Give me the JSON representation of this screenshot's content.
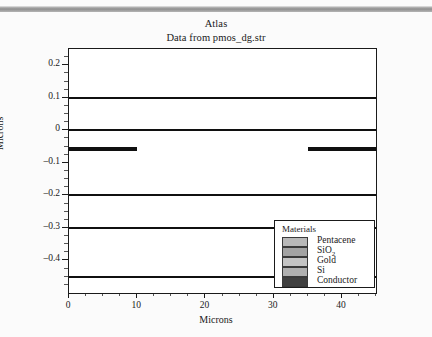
{
  "window": {
    "titlebar_name": "window-titlebar"
  },
  "header": {
    "title": "Atlas",
    "subtitle": "Data from pmos_dg.str"
  },
  "legend": {
    "title": "Materials",
    "items": [
      {
        "label": "Pentacene",
        "color": "#b8b8b8"
      },
      {
        "label": "SiO2",
        "color": "#a3a3a3"
      },
      {
        "label": "Gold",
        "color": "#c4c4c4"
      },
      {
        "label": "Si",
        "color": "#b0b0b0"
      },
      {
        "label": "Conductor",
        "color": "#404040"
      }
    ]
  },
  "chart_data": {
    "type": "area",
    "title": "Atlas",
    "subtitle": "Data from pmos_dg.str",
    "xlabel": "Microns",
    "ylabel": "Microns",
    "xlim": [
      0,
      45
    ],
    "ylim": [
      0.25,
      -0.5
    ],
    "xticks": [
      0,
      10,
      20,
      30,
      40
    ],
    "yticks": [
      -0.4,
      -0.3,
      -0.2,
      -0.1,
      0,
      0.1,
      0.2
    ],
    "xtick_labels": [
      "0",
      "10",
      "20",
      "30",
      "40"
    ],
    "ytick_labels": [
      "–0.4",
      "–0.3",
      "–0.2",
      "–0.1",
      "0",
      "0.1",
      "0.2"
    ],
    "grid": false,
    "legend_position": "bottom-right",
    "y_axis_inverted": true,
    "regions": [
      {
        "material": "background",
        "color": "#ffffff",
        "x0": 0,
        "x1": 45,
        "y0": -0.5,
        "y1": -0.45
      },
      {
        "material": "Conductor",
        "color": "#404040",
        "x0": 0,
        "x1": 45,
        "y0": -0.45,
        "y1": -0.3
      },
      {
        "material": "SiO2",
        "color": "#a3a3a3",
        "x0": 0,
        "x1": 45,
        "y0": -0.3,
        "y1": -0.2
      },
      {
        "material": "Pentacene",
        "color": "#c2c2c2",
        "x0": 0,
        "x1": 45,
        "y0": -0.2,
        "y1": 0.0
      },
      {
        "material": "SiO2",
        "color": "#a3a3a3",
        "x0": 0,
        "x1": 45,
        "y0": 0.0,
        "y1": 0.1
      },
      {
        "material": "Si",
        "color": "#b6b6b6",
        "x0": 0,
        "x1": 45,
        "y0": 0.1,
        "y1": 0.25
      },
      {
        "material": "Gold",
        "color": "#c2c2c2",
        "x0": 0,
        "x1": 10,
        "y0": -0.05,
        "y1": 0.0,
        "note": "source electrode"
      },
      {
        "material": "Gold",
        "color": "#c2c2c2",
        "x0": 35,
        "x1": 45,
        "y0": -0.05,
        "y1": 0.0,
        "note": "drain electrode"
      }
    ]
  }
}
